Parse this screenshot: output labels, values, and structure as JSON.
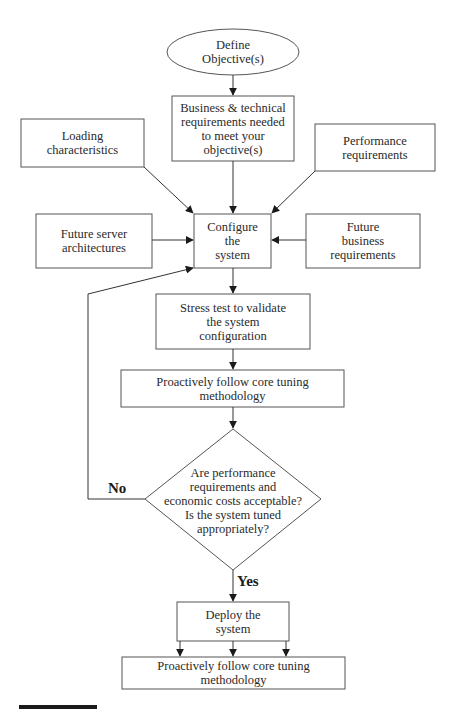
{
  "diagram": {
    "type": "flowchart",
    "colors": {
      "stroke": "#555555",
      "arrow": "#1a1a1a",
      "text": "#2a2a2a",
      "background": "#ffffff"
    },
    "nodes": {
      "define_objectives": {
        "shape": "ellipse",
        "label": "Define Objective(s)",
        "lines": [
          "Define",
          "Objective(s)"
        ]
      },
      "business_requirements": {
        "shape": "rect",
        "label": "Business & technical requirements needed to meet your objective(s)",
        "lines": [
          "Business & technical",
          "requirements needed",
          "to meet your",
          "objective(s)"
        ]
      },
      "loading_characteristics": {
        "shape": "rect",
        "label": "Loading characteristics",
        "lines": [
          "Loading",
          "characteristics"
        ]
      },
      "performance_requirements": {
        "shape": "rect",
        "label": "Performance requirements",
        "lines": [
          "Performance",
          "requirements"
        ]
      },
      "future_server": {
        "shape": "rect",
        "label": "Future server architectures",
        "lines": [
          "Future server",
          "architectures"
        ]
      },
      "configure_system": {
        "shape": "rect",
        "label": "Configure the system",
        "lines": [
          "Configure",
          "the",
          "system"
        ]
      },
      "future_business": {
        "shape": "rect",
        "label": "Future business requirements",
        "lines": [
          "Future",
          "business",
          "requirements"
        ]
      },
      "stress_test": {
        "shape": "rect",
        "label": "Stress test to validate the system configuration",
        "lines": [
          "Stress test to validate",
          "the system",
          "configuration"
        ]
      },
      "tuning_1": {
        "shape": "rect",
        "label": "Proactively follow core tuning methodology",
        "lines": [
          "Proactively follow core tuning",
          "methodology"
        ]
      },
      "decision": {
        "shape": "diamond",
        "label": "Are performance requirements and economic costs acceptable? Is the system tuned appropriately?",
        "lines": [
          "Are performance",
          "requirements and",
          "economic costs acceptable?",
          "Is the system tuned",
          "appropriately?"
        ]
      },
      "deploy": {
        "shape": "rect",
        "label": "Deploy the system",
        "lines": [
          "Deploy the",
          "system"
        ]
      },
      "tuning_2": {
        "shape": "rect",
        "label": "Proactively follow core tuning methodology",
        "lines": [
          "Proactively follow core tuning",
          "methodology"
        ]
      }
    },
    "edges": [
      {
        "from": "define_objectives",
        "to": "business_requirements"
      },
      {
        "from": "business_requirements",
        "to": "configure_system"
      },
      {
        "from": "loading_characteristics",
        "to": "configure_system"
      },
      {
        "from": "performance_requirements",
        "to": "configure_system"
      },
      {
        "from": "future_server",
        "to": "configure_system"
      },
      {
        "from": "future_business",
        "to": "configure_system"
      },
      {
        "from": "configure_system",
        "to": "stress_test"
      },
      {
        "from": "stress_test",
        "to": "tuning_1"
      },
      {
        "from": "tuning_1",
        "to": "decision"
      },
      {
        "from": "decision",
        "to": "configure_system",
        "label": "No"
      },
      {
        "from": "decision",
        "to": "deploy",
        "label": "Yes"
      },
      {
        "from": "deploy",
        "to": "tuning_2",
        "count": 3
      }
    ],
    "labels": {
      "no": "No",
      "yes": "Yes"
    }
  }
}
